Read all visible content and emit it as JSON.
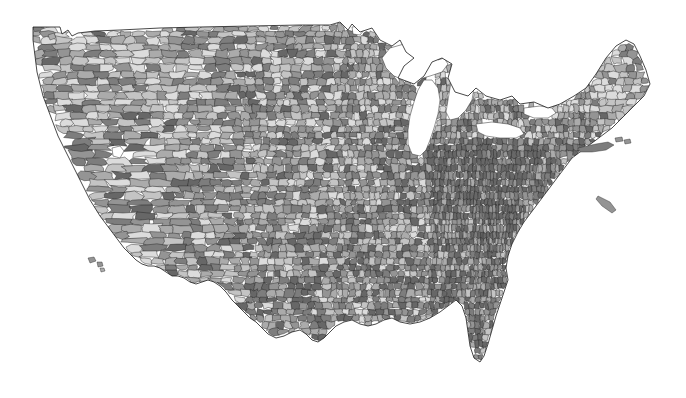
{
  "figure": {
    "type": "choropleth-map",
    "title": "",
    "subtitle": "",
    "region": "United States (contiguous 48 states)",
    "unit_level": "county",
    "background_color": "#ffffff",
    "border_color": "#242424",
    "water_color": "#ffffff",
    "projection": "albers-usa"
  },
  "chart_data": {
    "type": "heatmap",
    "title": "",
    "xlabel": "",
    "ylabel": "",
    "legend_position": "none",
    "grid": false,
    "geography": "us-counties",
    "palette_name": "grayscale-discrete",
    "palette": [
      "#dcdcdc",
      "#c4c4c4",
      "#ababab",
      "#949494",
      "#7d7d7d",
      "#676767"
    ],
    "bin_labels": [
      "lowest",
      "low",
      "mid-low",
      "mid-high",
      "high",
      "highest"
    ],
    "bin_share": [
      0.12,
      0.18,
      0.22,
      0.2,
      0.16,
      0.12
    ],
    "categories": [
      "Northwest",
      "Mountain West",
      "Southwest",
      "Great Plains",
      "Upper Midwest",
      "Great Lakes",
      "Northeast",
      "Southeast",
      "Gulf Coast"
    ],
    "values": [
      3,
      2,
      3,
      3,
      4,
      4,
      4,
      5,
      4
    ],
    "annotations": [],
    "water_bodies": [
      "Lake Superior",
      "Lake Michigan",
      "Lake Huron",
      "Lake Erie",
      "Lake Ontario",
      "Lake of the Woods",
      "Great Salt Lake"
    ]
  },
  "map": {
    "regions": [
      {
        "name": "washington",
        "shade": 2
      },
      {
        "name": "oregon",
        "shade": 3
      },
      {
        "name": "california",
        "shade": 3
      },
      {
        "name": "idaho",
        "shade": 2
      },
      {
        "name": "nevada",
        "shade": 4
      },
      {
        "name": "montana",
        "shade": 3
      },
      {
        "name": "wyoming",
        "shade": 3
      },
      {
        "name": "utah",
        "shade": 3
      },
      {
        "name": "arizona",
        "shade": 4
      },
      {
        "name": "colorado",
        "shade": 3
      },
      {
        "name": "new-mexico",
        "shade": 3
      },
      {
        "name": "north-dakota",
        "shade": 2
      },
      {
        "name": "south-dakota",
        "shade": 3
      },
      {
        "name": "nebraska",
        "shade": 3
      },
      {
        "name": "kansas",
        "shade": 3
      },
      {
        "name": "oklahoma",
        "shade": 4
      },
      {
        "name": "texas",
        "shade": 4
      },
      {
        "name": "minnesota",
        "shade": 3
      },
      {
        "name": "iowa",
        "shade": 3
      },
      {
        "name": "missouri",
        "shade": 4
      },
      {
        "name": "arkansas",
        "shade": 4
      },
      {
        "name": "louisiana",
        "shade": 4
      },
      {
        "name": "wisconsin",
        "shade": 3
      },
      {
        "name": "illinois",
        "shade": 4
      },
      {
        "name": "michigan",
        "shade": 4
      },
      {
        "name": "indiana",
        "shade": 4
      },
      {
        "name": "ohio",
        "shade": 4
      },
      {
        "name": "kentucky",
        "shade": 5
      },
      {
        "name": "tennessee",
        "shade": 5
      },
      {
        "name": "mississippi",
        "shade": 5
      },
      {
        "name": "alabama",
        "shade": 5
      },
      {
        "name": "georgia",
        "shade": 5
      },
      {
        "name": "florida",
        "shade": 4
      },
      {
        "name": "south-carolina",
        "shade": 4
      },
      {
        "name": "north-carolina",
        "shade": 4
      },
      {
        "name": "virginia",
        "shade": 5
      },
      {
        "name": "west-virginia",
        "shade": 5
      },
      {
        "name": "maryland",
        "shade": 4
      },
      {
        "name": "delaware",
        "shade": 3
      },
      {
        "name": "pennsylvania",
        "shade": 4
      },
      {
        "name": "new-jersey",
        "shade": 4
      },
      {
        "name": "new-york",
        "shade": 4
      },
      {
        "name": "connecticut",
        "shade": 3
      },
      {
        "name": "rhode-island",
        "shade": 3
      },
      {
        "name": "massachusetts",
        "shade": 3
      },
      {
        "name": "vermont",
        "shade": 3
      },
      {
        "name": "new-hampshire",
        "shade": 3
      },
      {
        "name": "maine",
        "shade": 2
      }
    ]
  }
}
